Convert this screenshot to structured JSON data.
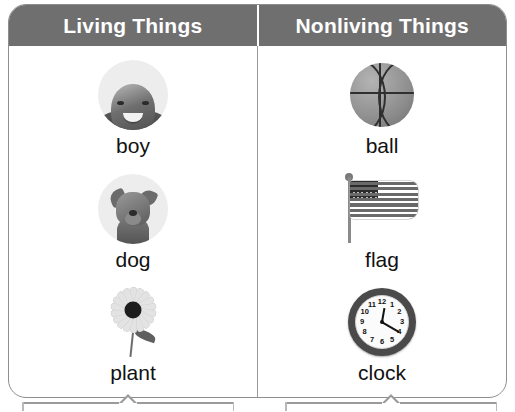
{
  "chart_data": {
    "type": "table",
    "columns": [
      "Living Things",
      "Nonliving Things"
    ],
    "rows": [
      [
        "boy",
        "ball"
      ],
      [
        "dog",
        "flag"
      ],
      [
        "plant",
        "clock"
      ]
    ]
  },
  "table": {
    "headers": {
      "left": "Living Things",
      "right": "Nonliving Things"
    },
    "left_column": [
      {
        "label": "boy",
        "icon": "boy-photo-icon"
      },
      {
        "label": "dog",
        "icon": "dog-photo-icon"
      },
      {
        "label": "plant",
        "icon": "flower-icon"
      }
    ],
    "right_column": [
      {
        "label": "ball",
        "icon": "basketball-icon"
      },
      {
        "label": "flag",
        "icon": "american-flag-icon"
      },
      {
        "label": "clock",
        "icon": "analog-clock-icon"
      }
    ]
  },
  "clock_face": {
    "numbers": [
      "12",
      "1",
      "2",
      "3",
      "4",
      "5",
      "6",
      "7",
      "8",
      "9",
      "10",
      "11"
    ]
  },
  "colors": {
    "header_background": "#6f6f6f",
    "header_text": "#ffffff",
    "border": "#8e8e8e",
    "divider": "#9a9a9a",
    "caption_text": "#111111",
    "page_background": "#ffffff"
  }
}
